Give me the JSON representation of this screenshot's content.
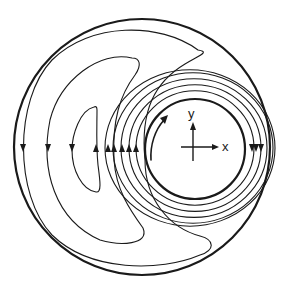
{
  "figure": {
    "ink_color": "#1a1a1a",
    "background": "#ffffff"
  },
  "axes_labels": {
    "x": "x",
    "y": "y"
  },
  "streamlines": {
    "left_down_arrows": 3,
    "left_up_arrows": 6,
    "right_down_arrows": 3,
    "rotation_direction": "counterclockwise"
  }
}
